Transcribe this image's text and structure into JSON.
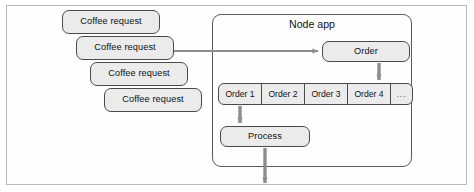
{
  "figure": {
    "type": "flow-diagram"
  },
  "colors": {
    "box_fill": "#ebebeb",
    "box_stroke": "#4a4a4a",
    "panel_stroke": "#5a5a5a",
    "arrow": "#8c8c8c",
    "frame": "#b9b9b9",
    "text": "#111111"
  },
  "requests": {
    "label": "Coffee request",
    "items": [
      {
        "label": "Coffee request"
      },
      {
        "label": "Coffee request"
      },
      {
        "label": "Coffee request"
      },
      {
        "label": "Coffee request"
      }
    ]
  },
  "node_app": {
    "title": "Node app",
    "intake": {
      "label": "Order"
    },
    "queue": {
      "cells": [
        {
          "label": "Order 1"
        },
        {
          "label": "Order 2"
        },
        {
          "label": "Order 3"
        },
        {
          "label": "Order 4"
        },
        {
          "label": "..."
        }
      ]
    },
    "process": {
      "label": "Process"
    }
  },
  "connectors": [
    {
      "name": "request-to-node-app",
      "from": "Coffee request",
      "to": "Order",
      "direction": "right"
    },
    {
      "name": "order-to-queue",
      "from": "Order",
      "to": "queue",
      "direction": "down"
    },
    {
      "name": "queue-to-process",
      "from": "Order 1",
      "to": "Process",
      "direction": "down"
    },
    {
      "name": "process-output",
      "from": "Process",
      "to": "outside",
      "direction": "down"
    }
  ]
}
